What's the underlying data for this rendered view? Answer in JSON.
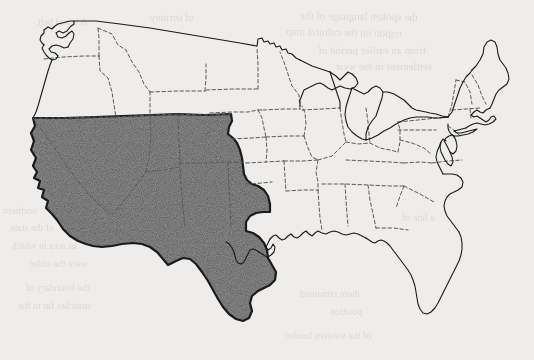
{
  "document": {
    "type": "scanned-map",
    "title": "United States map with shaded western region",
    "medium": "photocopy / scanned book page",
    "width": 534,
    "height": 360
  },
  "colors": {
    "paper": "#efeeec",
    "ink": "#1a1a1a",
    "shade_fill": "#9a9a9a",
    "shade_stipple_dark": "#2b2b2b",
    "state_border": "#5a5a5a",
    "bleed_text": "#000000"
  },
  "map": {
    "region_label": "Western and Southwestern United States",
    "projection_note": "conic, continental United States (lower 48)",
    "outline_stroke_width": 1.1,
    "region_stroke_width": 2.2,
    "state_border_style": "dashed",
    "state_border_dash": "3.5 2.5"
  },
  "legend": {
    "shaded_meaning": "highlighted states",
    "unshaded_meaning": "remaining states"
  },
  "shaded_states": [
    "California",
    "Nevada",
    "Utah",
    "Arizona",
    "New Mexico",
    "Colorado",
    "Wyoming",
    "Texas"
  ],
  "unshaded_states": [
    "Washington",
    "Oregon",
    "Idaho",
    "Montana",
    "North Dakota",
    "South Dakota",
    "Nebraska",
    "Kansas",
    "Oklahoma",
    "Minnesota",
    "Iowa",
    "Missouri",
    "Arkansas",
    "Louisiana",
    "Wisconsin",
    "Illinois",
    "Michigan",
    "Indiana",
    "Ohio",
    "Kentucky",
    "Tennessee",
    "Mississippi",
    "Alabama",
    "Georgia",
    "Florida",
    "South Carolina",
    "North Carolina",
    "Virginia",
    "West Virginia",
    "Maryland",
    "Delaware",
    "Pennsylvania",
    "New Jersey",
    "New York",
    "Connecticut",
    "Rhode Island",
    "Massachusetts",
    "Vermont",
    "New Hampshire",
    "Maine"
  ],
  "features": {
    "great_lakes": [
      "Lake Superior",
      "Lake Michigan",
      "Lake Huron",
      "Lake Erie",
      "Lake Ontario"
    ],
    "coastal": [
      "Puget Sound",
      "Chesapeake Bay",
      "Florida Peninsula",
      "Cape Cod",
      "Long Island",
      "Outer Banks"
    ]
  },
  "bleed_through_text": [
    {
      "text": "the spoken language of the",
      "x": 300,
      "y": 10,
      "size": 11,
      "rot": -1
    },
    {
      "text": "region on the cultural map",
      "x": 286,
      "y": 26,
      "size": 11,
      "rot": -1
    },
    {
      "text": "from an earlier period of",
      "x": 318,
      "y": 44,
      "size": 11,
      "rot": 0
    },
    {
      "text": "settlement in the west",
      "x": 336,
      "y": 60,
      "size": 11,
      "rot": 0
    },
    {
      "text": "A broad belt",
      "x": 38,
      "y": 16,
      "size": 10,
      "rot": 0
    },
    {
      "text": "of territory",
      "x": 150,
      "y": 12,
      "size": 10,
      "rot": 0
    },
    {
      "text": "northern",
      "x": 3,
      "y": 205,
      "size": 10,
      "rot": 0
    },
    {
      "text": "of the state",
      "x": 10,
      "y": 222,
      "size": 10,
      "rot": 0
    },
    {
      "text": "an area in which",
      "x": 12,
      "y": 240,
      "size": 10,
      "rot": 0
    },
    {
      "text": "were the older",
      "x": 30,
      "y": 258,
      "size": 10,
      "rot": 0
    },
    {
      "text": "the boundary of",
      "x": 26,
      "y": 282,
      "size": 10,
      "rot": 0
    },
    {
      "text": "stretches far to the",
      "x": 18,
      "y": 300,
      "size": 10,
      "rot": 0
    },
    {
      "text": "there remained",
      "x": 300,
      "y": 288,
      "size": 10,
      "rot": 0
    },
    {
      "text": "position",
      "x": 330,
      "y": 306,
      "size": 10,
      "rot": 0
    },
    {
      "text": "of the western border",
      "x": 286,
      "y": 330,
      "size": 10,
      "rot": 0
    },
    {
      "text": "a line of",
      "x": 402,
      "y": 212,
      "size": 10,
      "rot": 0
    }
  ]
}
